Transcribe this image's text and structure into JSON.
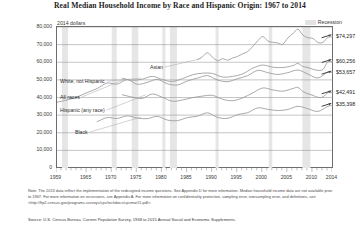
{
  "chart_data": {
    "type": "line",
    "title": "Real Median Household Income by Race and Hispanic Origin: 1967 to 2014",
    "units_label": "2014 dollars",
    "xlabel": "",
    "ylabel": "2014 dollars",
    "xlim": [
      1959,
      2014
    ],
    "ylim": [
      0,
      80000
    ],
    "grid": true,
    "legend_position": "top-right",
    "legend": [
      {
        "label": "Recession",
        "color": "#e3e3e3",
        "type": "band"
      }
    ],
    "yticks": [
      0,
      10000,
      20000,
      30000,
      40000,
      50000,
      60000,
      70000,
      80000
    ],
    "ytick_labels": [
      "0",
      "10,000",
      "20,000",
      "30,000",
      "40,000",
      "50,000",
      "60,000",
      "70,000",
      "80,000"
    ],
    "xticks": [
      1959,
      1965,
      1970,
      1975,
      1980,
      1985,
      1990,
      1995,
      2000,
      2005,
      2010,
      2014
    ],
    "xtick_labels": [
      "1959",
      "1965",
      "1970",
      "1975",
      "1980",
      "1985",
      "1990",
      "1995",
      "2000",
      "2005",
      "2010",
      "2014"
    ],
    "recessions": [
      {
        "start": 1960,
        "end": 1961.2
      },
      {
        "start": 1969.9,
        "end": 1970.9
      },
      {
        "start": 1973.9,
        "end": 1975.2
      },
      {
        "start": 1980.0,
        "end": 1980.6
      },
      {
        "start": 1981.5,
        "end": 1982.9
      },
      {
        "start": 1990.6,
        "end": 1991.2
      },
      {
        "start": 2001.2,
        "end": 2001.9
      },
      {
        "start": 2007.9,
        "end": 2009.5
      }
    ],
    "series": [
      {
        "name": "Asian",
        "label": "Asian",
        "end_value": 74297,
        "end_value_label": "$74,297",
        "x": [
          1987,
          1988,
          1989,
          1990,
          1991,
          1992,
          1993,
          1994,
          1995,
          1996,
          1997,
          1998,
          1999,
          2000,
          2001,
          2002,
          2003,
          2004,
          2005,
          2006,
          2007,
          2008,
          2009,
          2010,
          2011,
          2012,
          2013,
          2014
        ],
        "values": [
          61500,
          63200,
          65400,
          62800,
          60900,
          62000,
          61200,
          62400,
          63300,
          64800,
          66100,
          68900,
          72200,
          74600,
          72100,
          71300,
          70900,
          70200,
          73800,
          76200,
          78800,
          75400,
          73900,
          73500,
          71200,
          71300,
          74100,
          74297
        ]
      },
      {
        "name": "White, not Hispanic",
        "label": "White, not Hispanic",
        "end_value": 60256,
        "end_value_label": "$60,256",
        "x": [
          1972,
          1974,
          1976,
          1978,
          1980,
          1982,
          1984,
          1986,
          1988,
          1990,
          1992,
          1994,
          1996,
          1998,
          2000,
          2002,
          2004,
          2006,
          2007,
          2008,
          2009,
          2010,
          2011,
          2012,
          2013,
          2014
        ],
        "values": [
          50900,
          49800,
          50400,
          52000,
          50200,
          49100,
          50700,
          52900,
          53800,
          53600,
          51600,
          52000,
          53400,
          56600,
          58400,
          57200,
          57000,
          58100,
          59300,
          57600,
          57000,
          56000,
          55400,
          55900,
          60300,
          60256
        ]
      },
      {
        "name": "All races",
        "label": "All races",
        "end_value": 53657,
        "end_value_label": "$53,657",
        "x": [
          1959,
          1961,
          1963,
          1965,
          1967,
          1969,
          1971,
          1973,
          1975,
          1977,
          1979,
          1981,
          1983,
          1985,
          1987,
          1989,
          1991,
          1993,
          1995,
          1997,
          1999,
          2001,
          2003,
          2005,
          2007,
          2009,
          2011,
          2013,
          2014
        ],
        "values": [
          37300,
          38600,
          40300,
          42800,
          45100,
          48200,
          47600,
          50100,
          47500,
          48600,
          50300,
          47800,
          47100,
          49400,
          51000,
          52400,
          49900,
          49000,
          50700,
          52400,
          55400,
          54100,
          53100,
          54100,
          55600,
          53300,
          51100,
          54500,
          53657
        ]
      },
      {
        "name": "Hispanic (any race)",
        "label": "Hispanic (any race)",
        "end_value": 42491,
        "end_value_label": "$42,491",
        "x": [
          1972,
          1974,
          1976,
          1978,
          1980,
          1982,
          1984,
          1986,
          1988,
          1990,
          1992,
          1994,
          1996,
          1998,
          2000,
          2002,
          2004,
          2006,
          2007,
          2008,
          2009,
          2010,
          2011,
          2012,
          2013,
          2014
        ],
        "values": [
          41600,
          40200,
          39500,
          42000,
          40100,
          37900,
          38600,
          39900,
          40800,
          41200,
          39000,
          38200,
          39800,
          42600,
          45400,
          44300,
          43600,
          45100,
          45700,
          43400,
          42100,
          41200,
          40100,
          40300,
          42700,
          42491
        ]
      },
      {
        "name": "Black",
        "label": "Black",
        "end_value": 35398,
        "end_value_label": "$35,398",
        "x": [
          1967,
          1969,
          1971,
          1973,
          1975,
          1977,
          1979,
          1981,
          1983,
          1985,
          1987,
          1989,
          1991,
          1993,
          1995,
          1997,
          1999,
          2001,
          2003,
          2005,
          2007,
          2009,
          2011,
          2013,
          2014
        ],
        "values": [
          26300,
          28600,
          28100,
          29600,
          28300,
          28000,
          29300,
          27200,
          26900,
          28600,
          29400,
          31300,
          28700,
          28200,
          30300,
          31400,
          34100,
          33300,
          32600,
          33200,
          35000,
          33600,
          32100,
          35000,
          35398
        ]
      }
    ],
    "footnote": "Note: The 2013 data reflect the implementation of the redesigned income questions. See Appendix D for more information. Median household income data are not available prior to 1967. For more information on recessions, see Appendix A. For more information on confidentiality protection, sampling error, nonsampling error, and definitions, see <http://ftp2.census.gov/programs-surveys/cps/techdocs/cpsmar15.pdf>.",
    "source": "Source: U.S. Census Bureau, Current Population Survey, 1968 to 2015 Annual Social and Economic Supplements."
  }
}
